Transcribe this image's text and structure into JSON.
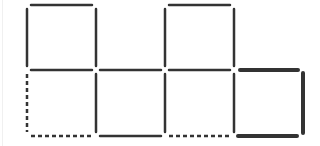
{
  "diagram": {
    "type": "matchstick-puzzle",
    "colors": {
      "stick": "#333333",
      "background": "#ffffff",
      "frame_edge": "#f0f0f0"
    },
    "grid": {
      "x": [
        27,
        96,
        165,
        234,
        303
      ],
      "y": [
        5,
        70,
        136
      ]
    },
    "sticks": [
      {
        "id": "top-a",
        "orientation": "h",
        "x1": 31,
        "y1": 5,
        "x2": 92,
        "y2": 5,
        "style": "solid"
      },
      {
        "id": "top-c",
        "orientation": "h",
        "x1": 169,
        "y1": 5,
        "x2": 230,
        "y2": 5,
        "style": "solid"
      },
      {
        "id": "upper-left-a",
        "orientation": "v",
        "x1": 27,
        "y1": 9,
        "x2": 66,
        "y2": 66,
        "style": "solid"
      },
      {
        "id": "upper-right-a",
        "orientation": "v",
        "x1": 96,
        "y1": 9,
        "x2": 96,
        "y2": 66,
        "style": "solid"
      },
      {
        "id": "upper-left-c",
        "orientation": "v",
        "x1": 165,
        "y1": 9,
        "x2": 165,
        "y2": 66,
        "style": "solid"
      },
      {
        "id": "upper-right-c",
        "orientation": "v",
        "x1": 234,
        "y1": 9,
        "x2": 234,
        "y2": 66,
        "style": "solid"
      },
      {
        "id": "mid-a",
        "orientation": "h",
        "x1": 31,
        "y1": 70,
        "x2": 92,
        "y2": 70,
        "style": "solid"
      },
      {
        "id": "mid-b",
        "orientation": "h",
        "x1": 100,
        "y1": 70,
        "x2": 161,
        "y2": 70,
        "style": "solid"
      },
      {
        "id": "mid-c",
        "orientation": "h",
        "x1": 169,
        "y1": 70,
        "x2": 230,
        "y2": 70,
        "style": "solid"
      },
      {
        "id": "mid-d",
        "orientation": "h",
        "x1": 240,
        "y1": 70,
        "x2": 298,
        "y2": 70,
        "style": "bold"
      },
      {
        "id": "lower-left-a",
        "orientation": "v",
        "x1": 27,
        "y1": 74,
        "x2": 27,
        "y2": 132,
        "style": "dashed"
      },
      {
        "id": "lower-a-b",
        "orientation": "v",
        "x1": 96,
        "y1": 74,
        "x2": 96,
        "y2": 132,
        "style": "solid"
      },
      {
        "id": "lower-b-c",
        "orientation": "v",
        "x1": 165,
        "y1": 74,
        "x2": 165,
        "y2": 132,
        "style": "solid"
      },
      {
        "id": "lower-c-d",
        "orientation": "v",
        "x1": 234,
        "y1": 74,
        "x2": 234,
        "y2": 132,
        "style": "solid"
      },
      {
        "id": "lower-right-d",
        "orientation": "v",
        "x1": 303,
        "y1": 73,
        "x2": 303,
        "y2": 133,
        "style": "bold"
      },
      {
        "id": "bottom-a",
        "orientation": "h",
        "x1": 31,
        "y1": 136,
        "x2": 92,
        "y2": 136,
        "style": "dashed"
      },
      {
        "id": "bottom-b",
        "orientation": "h",
        "x1": 100,
        "y1": 136,
        "x2": 161,
        "y2": 136,
        "style": "solid"
      },
      {
        "id": "bottom-c",
        "orientation": "h",
        "x1": 169,
        "y1": 136,
        "x2": 230,
        "y2": 136,
        "style": "dashed"
      },
      {
        "id": "bottom-d",
        "orientation": "h",
        "x1": 238,
        "y1": 136,
        "x2": 297,
        "y2": 136,
        "style": "bold"
      }
    ]
  }
}
